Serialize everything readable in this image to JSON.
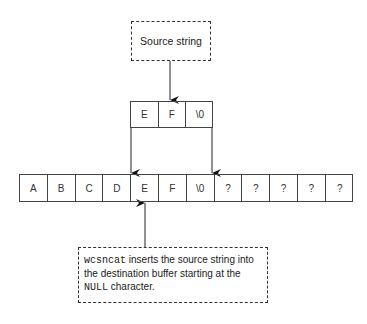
{
  "source_box": {
    "label": "Source string"
  },
  "source_array": {
    "cells": [
      "E",
      "F",
      "\\0"
    ]
  },
  "destination_array": {
    "cells": [
      "A",
      "B",
      "C",
      "D",
      "E",
      "F",
      "\\0",
      "?",
      "?",
      "?",
      "?",
      "?"
    ]
  },
  "note": {
    "code1": "wcsncat",
    "text1": " inserts the source string into the destination buffer starting at the ",
    "code2": "NULL",
    "text2": " character."
  }
}
